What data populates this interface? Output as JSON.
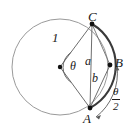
{
  "figure": {
    "canvas": {
      "width": 132,
      "height": 131
    },
    "colors": {
      "circle_outline": "#9a9a9a",
      "thick_arc": "#3a3a3a",
      "line": "#6e6e6e",
      "text": "#1a1a1a",
      "background": "#ffffff"
    },
    "labels": {
      "point_C": "C",
      "point_B": "B",
      "point_A": "A",
      "radius": "1",
      "central_angle": "θ",
      "chord_a": "a",
      "chord_b": "b",
      "arc_angle_numerator": "θ",
      "arc_angle_denominator": "2"
    },
    "geometry": {
      "center": {
        "x": 60,
        "y": 67
      },
      "radius": 48,
      "point_C": {
        "x": 92,
        "y": 24
      },
      "point_B": {
        "x": 110,
        "y": 65
      },
      "point_A": {
        "x": 90,
        "y": 108
      },
      "central_angle_degrees": 96
    }
  }
}
